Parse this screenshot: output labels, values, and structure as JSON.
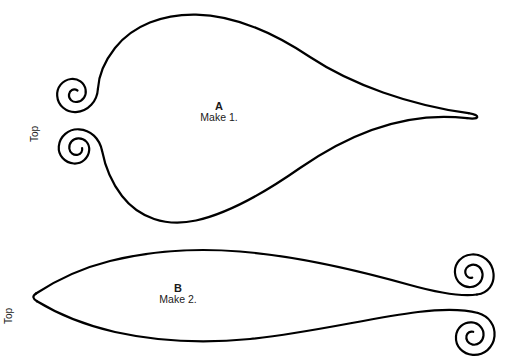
{
  "sheet": {
    "title": "Pattern Template Sheet",
    "background_color": "#ffffff",
    "ink_color": "#000000",
    "stroke_width": 2.2
  },
  "pieces": [
    {
      "id": "piece-a",
      "letter": "A",
      "quantity_label": "Make 1.",
      "top_marker": "Top",
      "description": "large leaf shape with two scroll spirals at left and a pointed tip at right"
    },
    {
      "id": "piece-b",
      "letter": "B",
      "quantity_label": "Make 2.",
      "top_marker": "Top",
      "description": "long leaf shape with a point at left and two scroll spirals at right"
    }
  ]
}
